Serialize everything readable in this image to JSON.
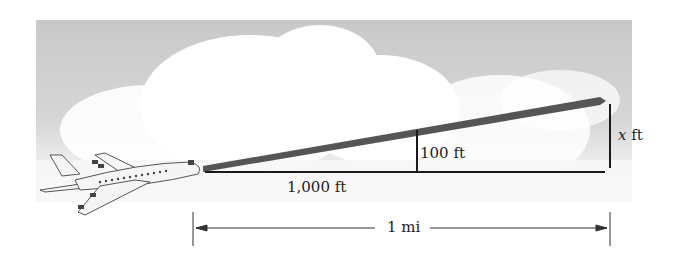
{
  "diagram": {
    "labels": {
      "base_distance": "1,000 ft",
      "small_height": "100 ft",
      "unknown_height_var": "x",
      "unknown_height_unit": " ft",
      "total_distance": "1 mi"
    },
    "colors": {
      "sky": "#cfcfcf",
      "cloud": "#ffffff",
      "flight_path": "#555555",
      "lines": "#1a1a1a"
    }
  }
}
